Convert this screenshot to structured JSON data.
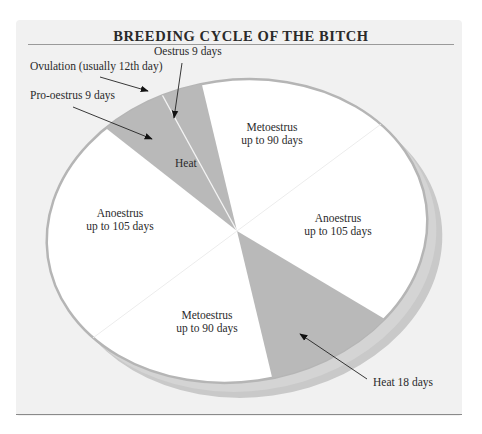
{
  "title": "BREEDING CYCLE OF THE BITCH",
  "colors": {
    "panel_bg": "#f1f1f1",
    "face": "#ffffff",
    "heat_wedge": "#b8b8b8",
    "rim": "#c8c8c8",
    "text": "#2b2b2b"
  },
  "segments": [
    {
      "name": "Metoestrus",
      "line1": "Metoestrus",
      "line2": "up to 90 days",
      "position": "top"
    },
    {
      "name": "Anoestrus",
      "line1": "Anoestrus",
      "line2": "up to 105 days",
      "position": "right"
    },
    {
      "name": "Metoestrus",
      "line1": "Metoestrus",
      "line2": "up to 90 days",
      "position": "bottom"
    },
    {
      "name": "Anoestrus",
      "line1": "Anoestrus",
      "line2": "up to 105 days",
      "position": "left"
    }
  ],
  "heat_label": "Heat",
  "callouts": {
    "oestrus": "Oestrus 9 days",
    "ovulation": "Ovulation (usually 12th day)",
    "pro_oestrus": "Pro-oestrus 9 days",
    "heat": "Heat 18 days"
  }
}
